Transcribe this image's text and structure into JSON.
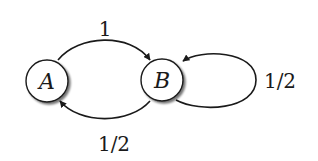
{
  "diagram": {
    "type": "state-transition-graph",
    "nodes": [
      {
        "id": "A",
        "label": "A"
      },
      {
        "id": "B",
        "label": "B"
      }
    ],
    "edges": [
      {
        "from": "A",
        "to": "B",
        "label": "1"
      },
      {
        "from": "B",
        "to": "A",
        "label": "1/2"
      },
      {
        "from": "B",
        "to": "B",
        "label": "1/2"
      }
    ]
  },
  "colors": {
    "stroke": "#1a1a1a",
    "node_fill": "#ffffff",
    "shadow": "#9a9a9a"
  }
}
